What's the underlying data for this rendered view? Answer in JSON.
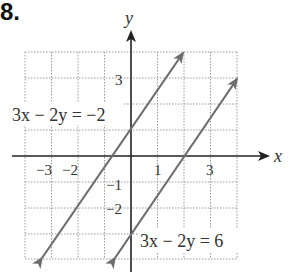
{
  "problem_number": "8.",
  "axes": {
    "x_label": "x",
    "y_label": "y",
    "x_ticks": [
      "−3",
      "−2",
      "1",
      "3"
    ],
    "y_ticks": [
      "3",
      "−1",
      "−2"
    ],
    "xlim": [
      -4,
      4
    ],
    "ylim": [
      -4,
      4
    ],
    "grid": true
  },
  "lines": [
    {
      "equation": "3x − 2y = −2",
      "slope": 1.5,
      "intercept": 1
    },
    {
      "equation": "3x − 2y = 6",
      "slope": 1.5,
      "intercept": -3
    }
  ],
  "colors": {
    "line": "#6e6e6e",
    "axis": "#222222",
    "grid": "#9a9a9a",
    "label": "#333333"
  }
}
